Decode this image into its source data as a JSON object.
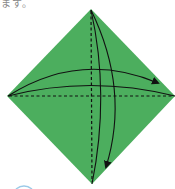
{
  "caption": "ます。",
  "diagram": {
    "type": "origami-fold-step",
    "paper_color": "#4cae5e",
    "line_color": "#111111",
    "accent_arc_color": "#5aa6d8",
    "shape": "diamond",
    "folds": [
      {
        "kind": "valley-dashed",
        "orientation": "vertical"
      },
      {
        "kind": "valley-dashed",
        "orientation": "horizontal"
      }
    ],
    "arrows": [
      {
        "direction": "left-to-right",
        "description": "fold left corner to right"
      },
      {
        "direction": "top-to-bottom",
        "description": "fold top corner to bottom"
      }
    ]
  }
}
